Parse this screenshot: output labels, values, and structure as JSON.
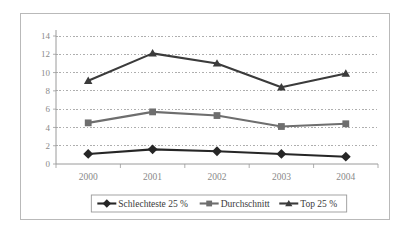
{
  "chart_data": {
    "type": "line",
    "title": "",
    "subtitle": "",
    "xlabel": "",
    "ylabel": "",
    "categories": [
      "2000",
      "2001",
      "2002",
      "2003",
      "2004"
    ],
    "ylim": [
      0,
      14
    ],
    "yticks": [
      "0",
      "2",
      "4",
      "6",
      "8",
      "10",
      "12",
      "14"
    ],
    "ytick_values": [
      0,
      2,
      4,
      6,
      8,
      10,
      12,
      14
    ],
    "grid": "horizontal-dashed",
    "legend_position": "bottom",
    "series": [
      {
        "name": "Schlechteste 25 %",
        "values": [
          1.1,
          1.6,
          1.4,
          1.1,
          0.8
        ],
        "color": "#262626",
        "marker": "diamond"
      },
      {
        "name": "Durchschnitt",
        "values": [
          4.5,
          5.7,
          5.3,
          4.1,
          4.4
        ],
        "color": "#6e6e6e",
        "marker": "square"
      },
      {
        "name": "Top 25 %",
        "values": [
          9.1,
          12.1,
          11.0,
          8.4,
          9.9
        ],
        "color": "#3b3b3b",
        "marker": "triangle"
      }
    ]
  },
  "colors": {
    "frame_border": "#b9b9b9",
    "axis_line": "#9a9a9a",
    "grid_line": "#9a9a9a",
    "tick_text": "#8a8a8a",
    "legend_border": "#9a9a9a",
    "legend_text": "#3a3a3a",
    "background": "#ffffff"
  }
}
